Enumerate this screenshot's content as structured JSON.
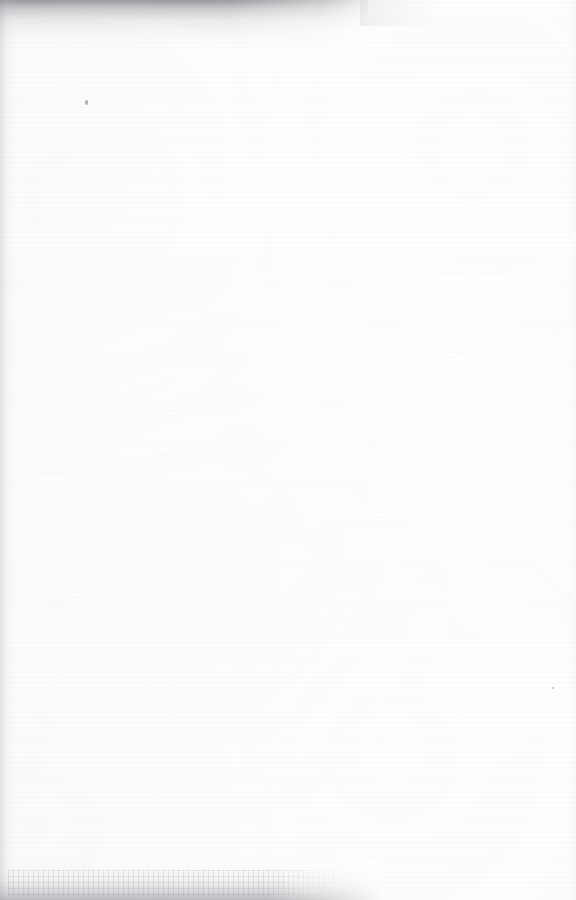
{
  "page": {
    "kind": "scanned-document-page",
    "surface": "verso",
    "content_state": "blank — only reverse-side show-through visible",
    "width_px": 576,
    "height_px": 900,
    "paper_color": "#fdfdfd",
    "ink_tone": "#55565c"
  },
  "shadows": {
    "top_band": {
      "name": "scanner-edge-shadow-top",
      "color": "#5c5e63",
      "extends_to_x": 368,
      "height_px": 52
    },
    "bottom_band": {
      "name": "scanner-edge-shadow-bottom",
      "color": "#787a80",
      "extends_to_x": 380,
      "height_px": 40
    },
    "left_edge": {
      "name": "scanner-edge-shadow-left",
      "color": "#96989e",
      "width_px": 16
    }
  },
  "bleed_through": {
    "legible": false,
    "note": "mirrored ink show-through from the reverse leaf; characters are not resolvable",
    "primary_block": {
      "label": "upper show-through paragraph",
      "line_count": 7,
      "lines": [
        "                                                                        ",
        "                                                                    ",
        "                                                             ",
        "                                                       ",
        "                                                 ",
        "                                             ",
        "                                        "
      ]
    },
    "secondary_block": {
      "label": "lower show-through paragraph",
      "line_count": 5,
      "lines": [
        "                                            ",
        "                                    ",
        "                                ",
        "                                      ",
        "                          "
      ]
    }
  },
  "artifacts": {
    "specks": [
      {
        "name": "speck-upper-left",
        "x": 85,
        "y": 100
      },
      {
        "name": "speck-lower-right",
        "x": 552,
        "y": 687
      }
    ]
  }
}
